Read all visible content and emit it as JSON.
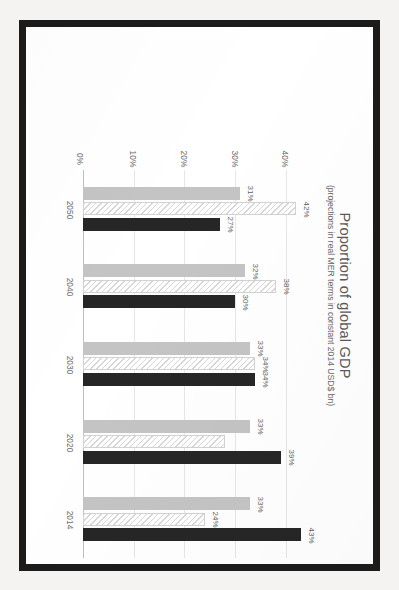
{
  "chart_data": {
    "type": "bar",
    "orientation": "horizontal",
    "title": "Proportion of global GDP",
    "subtitle": "(projections in real MER terms in constant 2014 USD$ bn)",
    "xlabel": "",
    "ylabel": "",
    "categories": [
      "2014",
      "2020",
      "2030",
      "2040",
      "2050"
    ],
    "value_ticks": [
      "0%",
      "10%",
      "20%",
      "30%",
      "40%"
    ],
    "value_tick_numbers": [
      0,
      10,
      20,
      30,
      40
    ],
    "xlim": [
      0,
      45
    ],
    "grid": true,
    "legend_position": "bottom",
    "series": [
      {
        "name": "G7 (Canada, France, Germany, Italy, Japan, United Kingdom, and United States)",
        "short": "G7",
        "color": "#262626",
        "pattern": "solid",
        "values": [
          43,
          39,
          34,
          30,
          27
        ],
        "labels": [
          "43%",
          "39%",
          "34%",
          "30%",
          "27%"
        ]
      },
      {
        "name": "E7 (Brazil, China, India, Indonesia, Mexico, Russia, and Turkey)",
        "short": "E7",
        "color": "#ffffff",
        "pattern": "diagonal-hatch",
        "values": [
          24,
          28,
          34,
          38,
          42
        ],
        "labels": [
          "24%",
          "",
          "34%",
          "38%",
          "42%"
        ]
      },
      {
        "name": "Rest of the world",
        "short": "Rest of the world",
        "color": "#c4c4c4",
        "pattern": "solid",
        "values": [
          33,
          33,
          33,
          32,
          31
        ],
        "labels": [
          "33%",
          "33%",
          "33%",
          "32%",
          "31%"
        ]
      }
    ]
  },
  "legend": {
    "entries": [
      {
        "label": "G7 (Canada, France, Germany, Italy, Japan, United Kingdom, and United States)",
        "swatch": "g7"
      },
      {
        "label": "E7 (Brazil, China, India, Indonesia, Mexico, Russia, and Turkey)",
        "swatch": "e7"
      },
      {
        "label": "Rest of the world",
        "swatch": "row"
      }
    ]
  },
  "colors": {
    "g7": "#262626",
    "e7": "#ffffff",
    "rest_of_world": "#c4c4c4",
    "frame": "#1b1b1b",
    "page": "#ffffff",
    "axis_text": "#6e6e6e",
    "gridline": "#e6e6e6"
  }
}
